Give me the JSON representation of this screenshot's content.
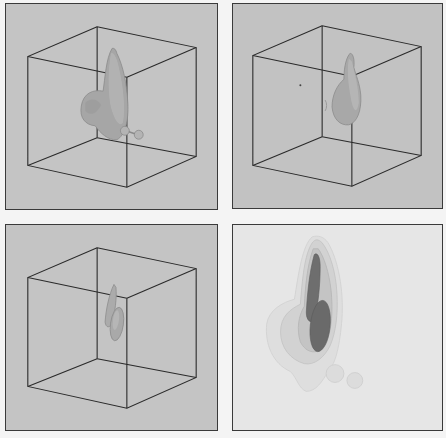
{
  "figure": {
    "background": "#f4f4f4",
    "panel_border": "#3a3a3a",
    "panels": [
      {
        "id": "top-left",
        "type": "3d-isosurface",
        "background": "#c4c4c4",
        "x": 5,
        "y": 3,
        "w": 213,
        "h": 207,
        "surface_color": "#a8a8a8"
      },
      {
        "id": "top-right",
        "type": "3d-isosurface",
        "background": "#c2c2c2",
        "x": 232,
        "y": 3,
        "w": 211,
        "h": 206,
        "surface_color": "#a9a9a9"
      },
      {
        "id": "bottom-left",
        "type": "3d-isosurface",
        "background": "#c4c4c4",
        "x": 5,
        "y": 224,
        "w": 213,
        "h": 207,
        "surface_color": "#aaaaaa"
      },
      {
        "id": "bottom-right",
        "type": "2d-contour-projection",
        "background": "#e6e6e6",
        "x": 232,
        "y": 224,
        "w": 211,
        "h": 207,
        "contour_colors": [
          "#dcdcdc",
          "#cfcfcf",
          "#bdbdbd",
          "#6e6e6e"
        ]
      }
    ]
  }
}
